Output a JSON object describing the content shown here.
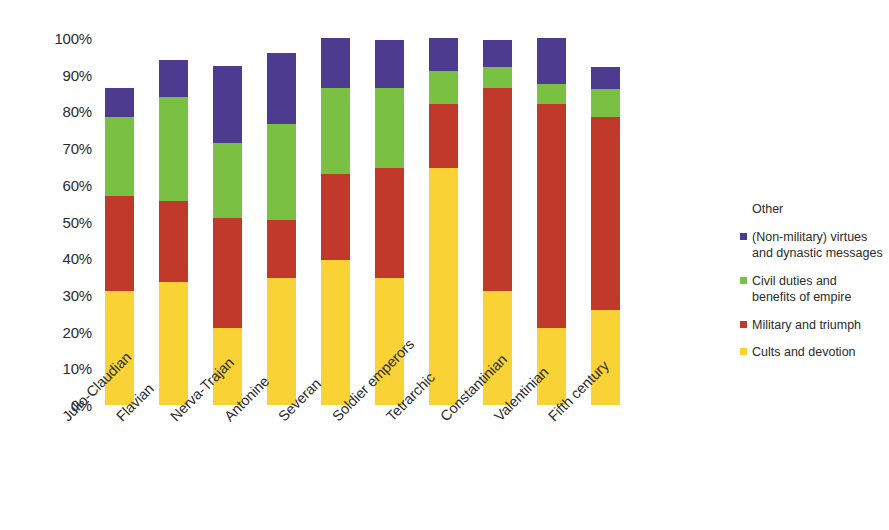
{
  "chart_data": {
    "type": "bar",
    "subtype": "stacked-bar-100-percent",
    "title": "",
    "xlabel": "",
    "ylabel": "",
    "ylim": [
      0,
      100
    ],
    "ytick_labels": [
      "0%",
      "10%",
      "20%",
      "30%",
      "40%",
      "50%",
      "60%",
      "70%",
      "80%",
      "90%",
      "100%"
    ],
    "ytick_values": [
      0,
      10,
      20,
      30,
      40,
      50,
      60,
      70,
      80,
      90,
      100
    ],
    "grid": false,
    "legend_position": "right",
    "legend_title": "Other",
    "categories": [
      "Julio-Claudian",
      "Flavian",
      "Nerva-Trajan",
      "Antonine",
      "Severan",
      "Soldier emperors",
      "Tetrarchic",
      "Constantinian",
      "Valentinian",
      "Fifth century"
    ],
    "series": [
      {
        "name": "Cults and devotion",
        "color": "#f9d335",
        "values": [
          31,
          33.5,
          21,
          34.5,
          39.5,
          34.5,
          64.5,
          31,
          21,
          26
        ]
      },
      {
        "name": "Military and triumph",
        "color": "#c0392b",
        "values": [
          26,
          22,
          30,
          16,
          23.5,
          30,
          17.5,
          55.5,
          61,
          52.5
        ]
      },
      {
        "name": "Civil duties and\nbenefits of empire",
        "color": "#7ac143",
        "values": [
          21.5,
          28.5,
          20.5,
          26,
          23.5,
          22,
          9,
          5.5,
          5.5,
          7.5
        ]
      },
      {
        "name": "(Non-military) virtues\nand dynastic messages",
        "color": "#4d3b8f",
        "values": [
          8,
          10,
          21,
          19.5,
          13.5,
          13,
          9,
          7.5,
          12.5,
          6
        ]
      }
    ],
    "totals": [
      86.5,
      94,
      92.5,
      96,
      100,
      99.5,
      100,
      99.5,
      100,
      92
    ]
  },
  "legend": {
    "title": "Other",
    "entries": [
      {
        "label": "(Non-military) virtues\nand dynastic messages",
        "color": "#4d3b8f"
      },
      {
        "label": "Civil duties and\nbenefits of empire",
        "color": "#7ac143"
      },
      {
        "label": "Military and triumph",
        "color": "#c0392b"
      },
      {
        "label": "Cults and devotion",
        "color": "#f9d335"
      }
    ]
  }
}
